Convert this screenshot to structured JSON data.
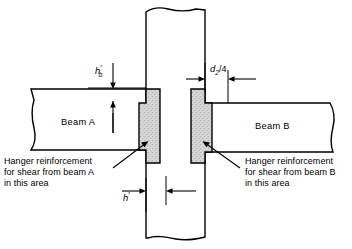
{
  "figure": {
    "type": "structural-engineering-detail",
    "title_visible": false,
    "colors": {
      "background": "#ffffff",
      "line": "#000000",
      "hanger_zone_fill": "#d4d4d4",
      "member_fill": "#ffffff"
    },
    "members": {
      "beam_a_label": "Beam A",
      "beam_b_label": "Beam B"
    },
    "annotations": {
      "note_left": {
        "line1": "Hanger reinforcement",
        "line2": "for shear from beam A",
        "line3": "in this area"
      },
      "note_right": {
        "line1": "Hanger reinforcement",
        "line2": "for shear from beam B",
        "line3": "in this area"
      }
    },
    "dimensions": {
      "hb": {
        "symbol": "h",
        "prime": "′",
        "subscript": "b",
        "full": "h′b"
      },
      "d2_over_4": {
        "symbol": "d",
        "subscript": "2",
        "divisor": "/4",
        "full": "d2/4"
      },
      "h_prime": {
        "symbol": "h",
        "prime": "′",
        "full": "h′"
      }
    }
  }
}
